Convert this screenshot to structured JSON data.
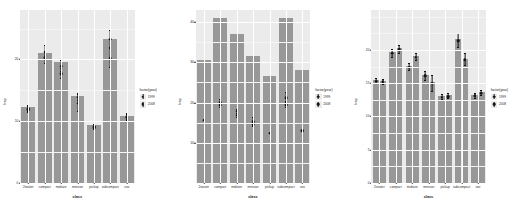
{
  "figure": {
    "panel_count": 3,
    "background": "#ffffff",
    "panel_background": "#ebebeb",
    "bar_fill": "#989898",
    "point_color": "#121212",
    "gridline_color": "#ffffff"
  },
  "legend": {
    "title": "factor(year)",
    "entries": [
      {
        "label": "1999",
        "key": "point-key"
      },
      {
        "label": "2008",
        "key": "point-key"
      }
    ]
  },
  "chart_data": [
    {
      "type": "bar",
      "title": "",
      "xlabel": "class",
      "ylabel": "hwy",
      "ylim": [
        0,
        28
      ],
      "yticks": [
        0,
        10,
        20
      ],
      "grid": true,
      "legend_position": "right",
      "legend_title": "factor(year)",
      "categories": [
        "2seater",
        "compact",
        "midsize",
        "minivan",
        "pickup",
        "subcompact",
        "suv"
      ],
      "bar_mode": "single",
      "values": [
        12.2,
        21.0,
        19.5,
        14.0,
        9.3,
        23.2,
        10.8
      ],
      "series": [
        {
          "name": "1999",
          "values": [
            12.0,
            21.3,
            19.0,
            14.0,
            9.1,
            23.4,
            10.7
          ]
        },
        {
          "name": "2008",
          "values": [
            12.1,
            20.4,
            17.8,
            13.0,
            9.2,
            20.3,
            10.8
          ]
        }
      ],
      "errors": [
        {
          "name": "1999",
          "values": [
            0.5,
            1.1,
            0.9,
            0.6,
            0.4,
            1.4,
            0.5
          ]
        },
        {
          "name": "2008",
          "values": [
            0.5,
            1.0,
            0.8,
            1.4,
            0.4,
            1.5,
            0.5
          ]
        }
      ]
    },
    {
      "type": "bar",
      "title": "",
      "xlabel": "class",
      "ylabel": "hwy",
      "ylim": [
        0,
        43
      ],
      "yticks": [
        10,
        20,
        30,
        40
      ],
      "grid": true,
      "legend_position": "right",
      "legend_title": "factor(year)",
      "categories": [
        "2seater",
        "compact",
        "midsize",
        "minivan",
        "pickup",
        "subcompact",
        "suv"
      ],
      "bar_mode": "single",
      "values": [
        30.5,
        41.0,
        37.0,
        31.5,
        26.5,
        41.0,
        28.0
      ],
      "series": [
        {
          "name": "1999",
          "values": [
            15.8,
            20.2,
            18.0,
            15.4,
            12.6,
            21.4,
            13.2
          ]
        },
        {
          "name": "2008",
          "values": [
            15.8,
            19.5,
            17.0,
            14.8,
            12.6,
            19.6,
            13.2
          ]
        }
      ],
      "errors": [
        {
          "name": "1999",
          "values": [
            0.0,
            0.7,
            0.5,
            0.9,
            0.0,
            1.3,
            0.0
          ]
        },
        {
          "name": "2008",
          "values": [
            0.0,
            0.6,
            0.5,
            0.7,
            0.0,
            0.8,
            0.0
          ]
        }
      ]
    },
    {
      "type": "bar",
      "title": "",
      "xlabel": "class",
      "ylabel": "hwy",
      "ylim": [
        0,
        26
      ],
      "yticks": [
        0,
        5,
        10,
        15,
        20
      ],
      "grid": true,
      "legend_position": "right",
      "legend_title": "factor(year)",
      "categories": [
        "2seater",
        "compact",
        "midsize",
        "minivan",
        "pickup",
        "subcompact",
        "suv"
      ],
      "bar_mode": "dodge",
      "series": [
        {
          "name": "1999",
          "values": [
            15.4,
            19.6,
            17.5,
            16.2,
            13.0,
            21.5,
            13.2
          ]
        },
        {
          "name": "2008",
          "values": [
            15.3,
            20.2,
            19.0,
            15.1,
            13.1,
            18.6,
            13.6
          ]
        }
      ],
      "errors": [
        {
          "name": "1999",
          "values": [
            0.4,
            0.6,
            0.5,
            0.7,
            0.4,
            1.1,
            0.4
          ]
        },
        {
          "name": "2008",
          "values": [
            0.4,
            0.6,
            0.5,
            1.2,
            0.4,
            0.9,
            0.4
          ]
        }
      ]
    }
  ]
}
